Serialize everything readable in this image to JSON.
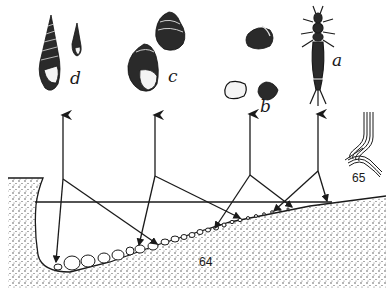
{
  "figure": {
    "type": "scientific-illustration",
    "colors": {
      "ink": "#1a1a1a",
      "background": "#ffffff"
    }
  },
  "organisms": [
    {
      "id": "d",
      "label": "d",
      "description": "tall turreted snail shells (two)",
      "arrow_x": 63
    },
    {
      "id": "c",
      "label": "c",
      "description": "rounded pond-snail shells (two)",
      "arrow_x": 155
    },
    {
      "id": "b",
      "label": "b",
      "description": "small bivalve/clam shells (three)",
      "arrow_x": 249
    },
    {
      "id": "a",
      "label": "a",
      "description": "aquatic insect larva",
      "arrow_x": 318
    }
  ],
  "callouts": {
    "basin_label": "64",
    "plant_label": "65"
  }
}
